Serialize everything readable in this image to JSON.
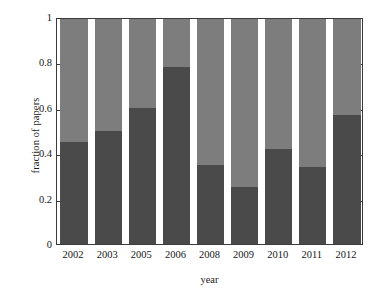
{
  "chart_data": {
    "type": "bar",
    "subtype": "stacked-100-percent",
    "title": "",
    "xlabel": "year",
    "ylabel": "fraction of papers",
    "categories": [
      "2002",
      "2003",
      "2005",
      "2006",
      "2008",
      "2009",
      "2010",
      "2011",
      "2012"
    ],
    "series": [
      {
        "name": "lower-segment",
        "color": "#4a4a4a",
        "values": [
          0.45,
          0.5,
          0.6,
          0.78,
          0.35,
          0.25,
          0.42,
          0.34,
          0.57
        ]
      },
      {
        "name": "upper-segment",
        "color": "#7d7d7d",
        "values": [
          0.55,
          0.5,
          0.4,
          0.22,
          0.65,
          0.75,
          0.58,
          0.66,
          0.43
        ]
      }
    ],
    "ylim": [
      0,
      1
    ],
    "yticks": [
      0,
      0.2,
      0.4,
      0.6,
      0.8,
      1
    ],
    "ytick_labels": [
      "0",
      "0.2",
      "0.4",
      "0.6",
      "0.8",
      "1"
    ],
    "grid": false,
    "legend": "none",
    "ticks_both_sides": true
  },
  "axes": {
    "ylabel": "fraction of papers",
    "xlabel": "year"
  }
}
